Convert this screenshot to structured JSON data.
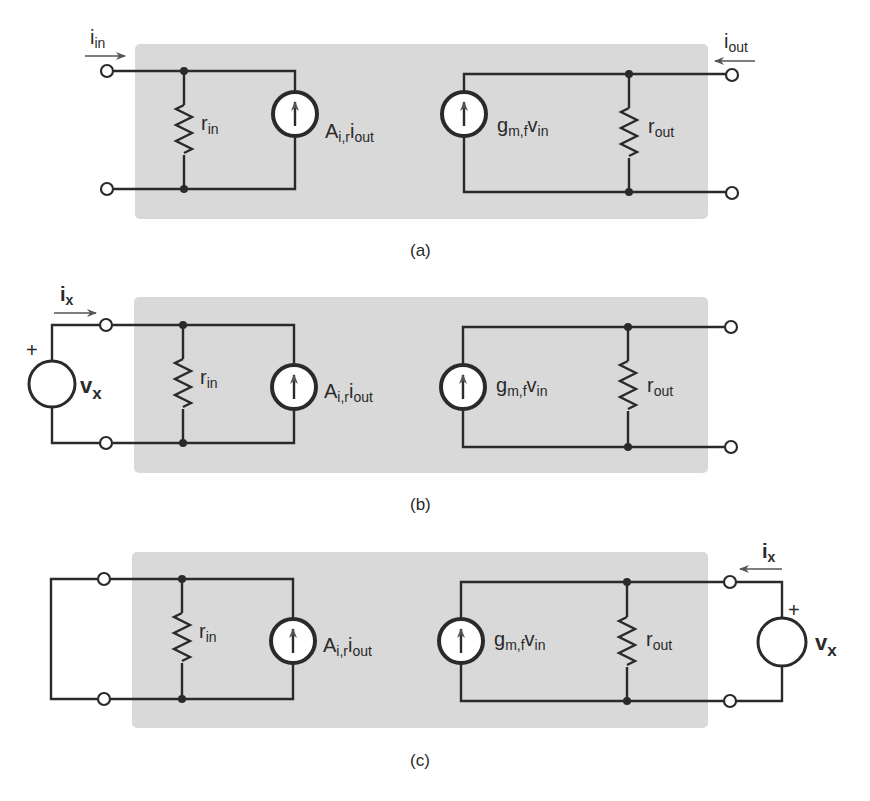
{
  "figure": {
    "colors": {
      "box_fill": "#d9d9d9",
      "wire": "#2a2a2a",
      "background": "#ffffff"
    },
    "panels": [
      {
        "caption": "(a)",
        "input_current": {
          "base": "i",
          "sub": "in",
          "direction": "into input port"
        },
        "output_current": {
          "base": "i",
          "sub": "out",
          "direction": "into output port"
        },
        "r_in": {
          "base": "r",
          "sub": "in"
        },
        "input_source": {
          "base": "A",
          "sub1": "i,r",
          "base2": "i",
          "sub2": "out"
        },
        "output_source": {
          "base": "g",
          "sub1": "m,f",
          "base2": "v",
          "sub2": "in"
        },
        "r_out": {
          "base": "r",
          "sub": "out"
        }
      },
      {
        "caption": "(b)",
        "test_current": {
          "base": "i",
          "sub": "x",
          "direction": "into input port"
        },
        "test_source": {
          "base": "v",
          "sub": "x",
          "polarity": "+",
          "side": "input"
        },
        "r_in": {
          "base": "r",
          "sub": "in"
        },
        "input_source": {
          "base": "A",
          "sub1": "i,r",
          "base2": "i",
          "sub2": "out"
        },
        "output_source": {
          "base": "g",
          "sub1": "m,f",
          "base2": "v",
          "sub2": "in"
        },
        "r_out": {
          "base": "r",
          "sub": "out"
        },
        "output_port": "open"
      },
      {
        "caption": "(c)",
        "test_current": {
          "base": "i",
          "sub": "x",
          "direction": "into output port"
        },
        "test_source": {
          "base": "v",
          "sub": "x",
          "polarity": "+",
          "side": "output"
        },
        "r_in": {
          "base": "r",
          "sub": "in"
        },
        "input_source": {
          "base": "A",
          "sub1": "i,r",
          "base2": "i",
          "sub2": "out"
        },
        "output_source": {
          "base": "g",
          "sub1": "m,f",
          "base2": "v",
          "sub2": "in"
        },
        "r_out": {
          "base": "r",
          "sub": "out"
        },
        "input_port": "short"
      }
    ]
  }
}
